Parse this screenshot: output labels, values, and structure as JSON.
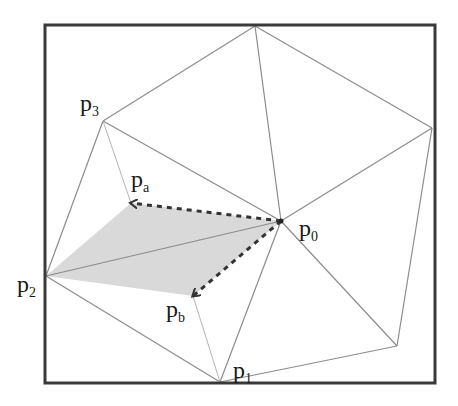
{
  "diagram": {
    "type": "triangulation",
    "frame": {
      "x": 45,
      "y": 25,
      "w": 390,
      "h": 358,
      "color": "#3a3a3a"
    },
    "colors": {
      "edge": "#8c8c8c",
      "edge_light": "#b5b5b5",
      "dashed": "#333333",
      "fill": "#d9d9d9"
    },
    "vertices": {
      "p0": {
        "x": 281,
        "y": 221
      },
      "p1": {
        "x": 220,
        "y": 382
      },
      "p2": {
        "x": 46,
        "y": 276
      },
      "p3": {
        "x": 103,
        "y": 121
      },
      "pa": {
        "x": 131,
        "y": 203
      },
      "pb": {
        "x": 193,
        "y": 296
      },
      "top": {
        "x": 255,
        "y": 26
      },
      "right": {
        "x": 432,
        "y": 128
      },
      "bottom_right": {
        "x": 397,
        "y": 346
      }
    },
    "labels": {
      "p0": {
        "base": "p",
        "sub": "0"
      },
      "p1": {
        "base": "p",
        "sub": "1"
      },
      "p2": {
        "base": "p",
        "sub": "2"
      },
      "p3": {
        "base": "p",
        "sub": "3"
      },
      "pa": {
        "base": "p",
        "sub": "a"
      },
      "pb": {
        "base": "p",
        "sub": "b"
      }
    },
    "edges": [
      [
        "top",
        "p3"
      ],
      [
        "top",
        "p0"
      ],
      [
        "top",
        "right"
      ],
      [
        "p3",
        "p0"
      ],
      [
        "p3",
        "p2"
      ],
      [
        "right",
        "p0"
      ],
      [
        "right",
        "bottom_right"
      ],
      [
        "p0",
        "bottom_right"
      ],
      [
        "p0",
        "p1"
      ],
      [
        "p0",
        "p2"
      ],
      [
        "bottom_right",
        "p1"
      ],
      [
        "p2",
        "p1"
      ]
    ],
    "light_edges": [
      [
        "p3",
        "pa"
      ],
      [
        "pb",
        "p1"
      ]
    ],
    "dashed_arrows": [
      [
        "p0",
        "pa"
      ],
      [
        "p0",
        "pb"
      ]
    ],
    "shaded_region": [
      "p2",
      "pa",
      "p0",
      "pb"
    ]
  }
}
